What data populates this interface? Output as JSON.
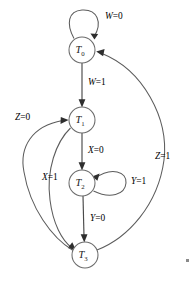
{
  "diagram": {
    "type": "state-transition-diagram",
    "width": 192,
    "height": 284,
    "background_color": "#ffffff",
    "line_color": "#5c5c5c",
    "text_color": "#1a1a1a"
  },
  "states": [
    {
      "id": "T0",
      "name": "T",
      "subscript": "0",
      "cx": 82,
      "cy": 50,
      "r": 13
    },
    {
      "id": "T1",
      "name": "T",
      "subscript": "1",
      "cx": 82,
      "cy": 120,
      "r": 13
    },
    {
      "id": "T2",
      "name": "T",
      "subscript": "2",
      "cx": 82,
      "cy": 183,
      "r": 13
    },
    {
      "id": "T3",
      "name": "T",
      "subscript": "3",
      "cx": 85,
      "cy": 255,
      "r": 13
    }
  ],
  "transitions": [
    {
      "id": "t0-self",
      "from": "T0",
      "to": "T0",
      "variable": "W",
      "value": "0",
      "label": "W=0",
      "label_x": 105,
      "label_y": 12,
      "kind": "self-loop-top"
    },
    {
      "id": "t0-t1",
      "from": "T0",
      "to": "T1",
      "variable": "W",
      "value": "1",
      "label": "W=1",
      "label_x": 88,
      "label_y": 78,
      "kind": "straight-down"
    },
    {
      "id": "t1-t2",
      "from": "T1",
      "to": "T2",
      "variable": "X",
      "value": "0",
      "label": "X=0",
      "label_x": 88,
      "label_y": 146,
      "kind": "straight-down"
    },
    {
      "id": "t2-self",
      "from": "T2",
      "to": "T2",
      "variable": "Y",
      "value": "1",
      "label": "Y=1",
      "label_x": 131,
      "label_y": 177,
      "kind": "self-loop-right"
    },
    {
      "id": "t2-t3",
      "from": "T2",
      "to": "T3",
      "variable": "Y",
      "value": "0",
      "label": "Y=0",
      "label_x": 90,
      "label_y": 214,
      "kind": "straight-down"
    },
    {
      "id": "t1-t3",
      "from": "T1",
      "to": "T3",
      "variable": "X",
      "value": "1",
      "label": "X=1",
      "label_x": 42,
      "label_y": 173,
      "kind": "curve-left-inner"
    },
    {
      "id": "t3-t1",
      "from": "T3",
      "to": "T1",
      "variable": "Z",
      "value": "0",
      "label": "Z=0",
      "label_x": 15,
      "label_y": 113,
      "kind": "curve-left-outer"
    },
    {
      "id": "t3-t0",
      "from": "T3",
      "to": "T0",
      "variable": "Z",
      "value": "1",
      "label": "Z=1",
      "label_x": 155,
      "label_y": 152,
      "kind": "curve-right-long"
    }
  ]
}
